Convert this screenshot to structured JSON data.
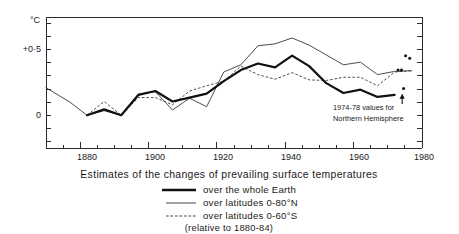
{
  "chart_data": {
    "type": "line",
    "title": "Estimates of the changes of prevailing surface temperatures",
    "subtitle": "(relative to 1880-84)",
    "xlabel": "",
    "ylabel": "°C",
    "y_unit_label": "°C",
    "xlim": [
      1870,
      1980
    ],
    "ylim": [
      -0.25,
      0.75
    ],
    "xticks": [
      1880,
      1900,
      1920,
      1940,
      1960,
      1980
    ],
    "xticklabels": [
      "1880",
      "1900",
      "1920",
      "1940",
      "1960",
      "1980"
    ],
    "yticks": [
      -0.2,
      -0.1,
      0.0,
      0.1,
      0.2,
      0.3,
      0.4,
      0.5,
      0.6,
      0.7
    ],
    "yticklabels_shown": [
      {
        "value": 0.5,
        "label": "+0·5"
      },
      {
        "value": 0.0,
        "label": "0"
      }
    ],
    "grid": false,
    "legend_position": "below-plot",
    "series": [
      {
        "name": "over the whole Earth",
        "style": "solid-thick",
        "color": "#111111",
        "x": [
          1882,
          1887,
          1892,
          1897,
          1902,
          1907,
          1912,
          1917,
          1922,
          1927,
          1932,
          1937,
          1942,
          1947,
          1952,
          1957,
          1962,
          1967,
          1972
        ],
        "values": [
          0.0,
          0.045,
          0.0,
          0.155,
          0.185,
          0.105,
          0.135,
          0.165,
          0.26,
          0.345,
          0.395,
          0.365,
          0.455,
          0.375,
          0.245,
          0.17,
          0.195,
          0.14,
          0.155
        ]
      },
      {
        "name": "over latitudes 0-80°N",
        "style": "solid-thin",
        "color": "#3a3a3a",
        "x": [
          1870,
          1877,
          1882,
          1887,
          1892,
          1897,
          1902,
          1907,
          1912,
          1917,
          1922,
          1927,
          1932,
          1937,
          1942,
          1947,
          1952,
          1957,
          1962,
          1967,
          1972,
          1977
        ],
        "values": [
          0.21,
          0.1,
          0.0,
          0.035,
          0.0,
          0.16,
          0.18,
          0.04,
          0.13,
          0.065,
          0.33,
          0.385,
          0.53,
          0.545,
          0.59,
          0.535,
          0.46,
          0.385,
          0.405,
          0.31,
          0.335,
          0.34
        ]
      },
      {
        "name": "over latitudes 0-60°S",
        "style": "dashed-thin",
        "color": "#3a3a3a",
        "x": [
          1882,
          1887,
          1892,
          1897,
          1902,
          1907,
          1912,
          1917,
          1922,
          1927,
          1932,
          1937,
          1942,
          1947,
          1952,
          1957,
          1962,
          1967,
          1972,
          1977
        ],
        "values": [
          0.0,
          0.105,
          0.0,
          0.135,
          0.135,
          0.08,
          0.185,
          0.225,
          0.26,
          0.375,
          0.31,
          0.275,
          0.325,
          0.27,
          0.265,
          0.29,
          0.29,
          0.225,
          0.33,
          0.34
        ]
      }
    ],
    "scatter_points": {
      "name": "1974-78 Northern Hemisphere values",
      "color": "#111111",
      "points": [
        {
          "x": 1975.2,
          "y": 0.455
        },
        {
          "x": 1976.4,
          "y": 0.435
        },
        {
          "x": 1973.0,
          "y": 0.345
        },
        {
          "x": 1974.0,
          "y": 0.345
        },
        {
          "x": 1974.6,
          "y": 0.205
        }
      ]
    },
    "annotations": [
      {
        "text_lines": [
          "1974-78 values for",
          "Northern Hemisphere"
        ],
        "x": 1963.0,
        "y": 0.06,
        "arrow_from": {
          "x": 1974.2,
          "y": 0.085
        },
        "arrow_to": {
          "x": 1974.2,
          "y": 0.165
        }
      }
    ]
  },
  "legend": {
    "items": [
      {
        "label": "over the whole Earth",
        "style": "solid-thick"
      },
      {
        "label": "over latitudes 0-80°N",
        "style": "solid-thin"
      },
      {
        "label": "over latitudes 0-60°S",
        "style": "dashed-thin"
      }
    ],
    "note": "(relative to 1880-84)"
  },
  "caption": {
    "text": "Estimates of the changes of prevailing surface temperatures"
  },
  "annotation_block": {
    "line1": "1974-78 values for",
    "line2": "Northern Hemisphere"
  },
  "axes": {
    "y_unit": "°C",
    "y_label_half": "+0·5",
    "y_label_zero": "0",
    "x_1880": "1880",
    "x_1900": "1900",
    "x_1920": "1920",
    "x_1940": "1940",
    "x_1960": "1960",
    "x_1980": "1980"
  }
}
